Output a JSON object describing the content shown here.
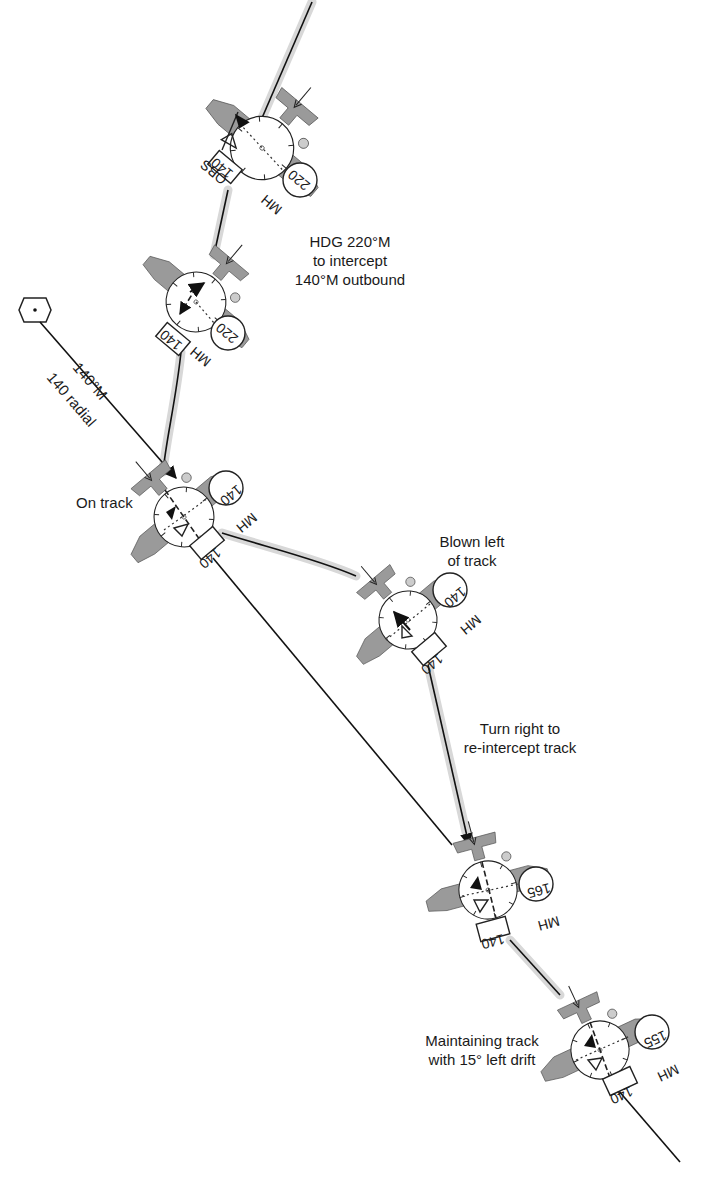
{
  "diagram": {
    "type": "VOR tracking / wind drift diagram",
    "station": {
      "icon": "vor-station-hexagon",
      "radial_label": "140°M",
      "radial_sublabel": "140 radial"
    },
    "annotations": {
      "intercept": [
        "HDG 220°M",
        "to intercept",
        "140°M outbound"
      ],
      "on_track": "On track",
      "blown_left": [
        "Blown left",
        "of track"
      ],
      "turn_right": [
        "Turn right to",
        "re-intercept track"
      ],
      "maintaining": [
        "Maintaining track",
        "with 15° left drift"
      ]
    },
    "aircraft": [
      {
        "id": "a1",
        "obs": "140",
        "obs_label": "OBS",
        "mh": "220",
        "mh_label": "MH"
      },
      {
        "id": "a2",
        "obs": "140",
        "mh": "220",
        "mh_label": "MH"
      },
      {
        "id": "a3",
        "obs": "140",
        "mh": "140",
        "mh_label": "MH"
      },
      {
        "id": "a4",
        "obs": "140",
        "mh": "140",
        "mh_label": "MH"
      },
      {
        "id": "a5",
        "obs": "140",
        "mh": "165",
        "mh_label": "MH"
      },
      {
        "id": "a6",
        "obs": "140",
        "mh": "155",
        "mh_label": "MH"
      }
    ],
    "colors": {
      "aircraft_fill": "#9a9a9a",
      "track_line": "#111111",
      "halo": "#d8d8d8"
    }
  }
}
